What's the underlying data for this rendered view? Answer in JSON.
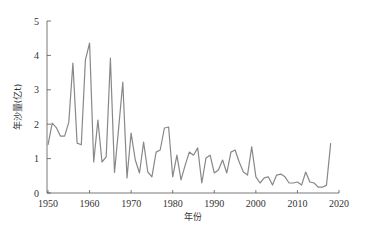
{
  "chart_data": {
    "type": "line",
    "title": "",
    "xlabel": "年份",
    "ylabel": "年沙量(亿t)",
    "xlim": [
      1950,
      2020
    ],
    "ylim": [
      0,
      5
    ],
    "xticks": [
      1950,
      1960,
      1970,
      1980,
      1990,
      2000,
      2010,
      2020
    ],
    "yticks": [
      0,
      1,
      2,
      3,
      4,
      5
    ],
    "grid": false,
    "legend": null,
    "line_color": "#888888",
    "x": [
      1950,
      1951,
      1952,
      1953,
      1954,
      1955,
      1956,
      1957,
      1958,
      1959,
      1960,
      1961,
      1962,
      1963,
      1964,
      1965,
      1966,
      1967,
      1968,
      1969,
      1970,
      1971,
      1972,
      1973,
      1974,
      1975,
      1976,
      1977,
      1978,
      1979,
      1980,
      1981,
      1982,
      1983,
      1984,
      1985,
      1986,
      1987,
      1988,
      1989,
      1990,
      1991,
      1992,
      1993,
      1994,
      1995,
      1996,
      1997,
      1998,
      1999,
      2000,
      2001,
      2002,
      2003,
      2004,
      2005,
      2006,
      2007,
      2008,
      2009,
      2010,
      2011,
      2012,
      2013,
      2014,
      2015,
      2016,
      2017,
      2018
    ],
    "series": [
      {
        "name": "年沙量",
        "values": [
          1.4,
          2.03,
          1.9,
          1.65,
          1.65,
          2.06,
          3.78,
          1.45,
          1.4,
          3.87,
          4.36,
          0.9,
          2.12,
          0.9,
          1.05,
          3.92,
          0.6,
          1.9,
          3.22,
          0.44,
          1.74,
          0.96,
          0.58,
          1.48,
          0.61,
          0.47,
          1.19,
          1.25,
          1.89,
          1.92,
          0.47,
          1.1,
          0.38,
          0.81,
          1.19,
          1.1,
          1.31,
          0.29,
          1.02,
          1.1,
          0.58,
          0.67,
          0.96,
          0.58,
          1.19,
          1.25,
          0.9,
          0.61,
          0.52,
          1.34,
          0.47,
          0.29,
          0.44,
          0.47,
          0.23,
          0.52,
          0.55,
          0.47,
          0.29,
          0.29,
          0.32,
          0.23,
          0.61,
          0.32,
          0.29,
          0.17,
          0.17,
          0.23,
          1.45
        ]
      }
    ]
  }
}
